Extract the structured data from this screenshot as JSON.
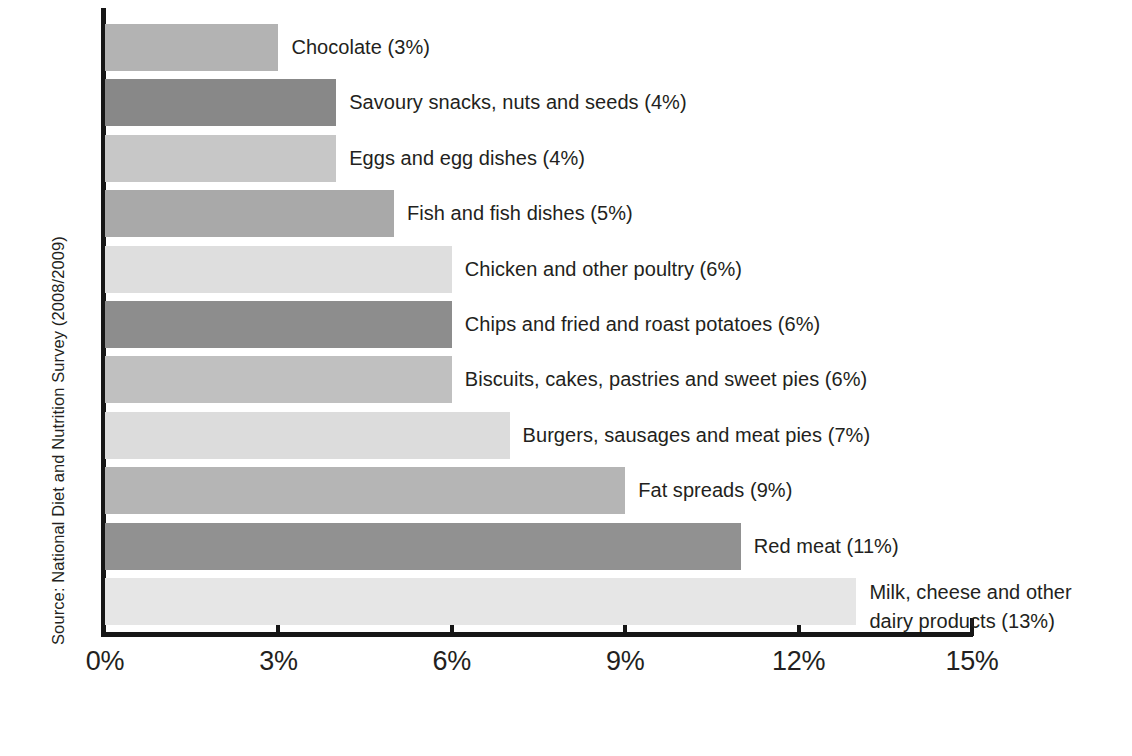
{
  "chart_data": {
    "type": "bar",
    "orientation": "horizontal",
    "title": "",
    "subtitle": "",
    "xlabel": "",
    "ylabel": "Source: National Diet and Nutrition Survey (2008/2009)",
    "xlim": [
      0,
      15
    ],
    "xticks": [
      0,
      3,
      6,
      9,
      12,
      15
    ],
    "xtick_labels": [
      "0%",
      "3%",
      "6%",
      "9%",
      "12%",
      "15%"
    ],
    "grid": false,
    "legend": false,
    "categories": [
      "Chocolate",
      "Savoury snacks, nuts and seeds",
      "Eggs and egg dishes",
      "Fish and fish dishes",
      "Chicken and other poultry",
      "Chips and fried and roast potatoes",
      "Biscuits, cakes, pastries and sweet pies",
      "Burgers, sausages and meat pies",
      "Fat spreads",
      "Red meat",
      "Milk, cheese and other dairy products"
    ],
    "values": [
      3,
      4,
      4,
      5,
      6,
      6,
      6,
      7,
      9,
      11,
      13
    ],
    "value_unit": "%",
    "bars": [
      {
        "label": "Chocolate (3%)",
        "value": 3,
        "color": "#b3b3b3",
        "lines": 1
      },
      {
        "label": "Savoury snacks, nuts and seeds (4%)",
        "value": 4,
        "color": "#888888",
        "lines": 1
      },
      {
        "label": "Eggs and egg dishes (4%)",
        "value": 4,
        "color": "#c7c7c7",
        "lines": 1
      },
      {
        "label": "Fish and fish dishes (5%)",
        "value": 5,
        "color": "#a9a9a9",
        "lines": 1
      },
      {
        "label": "Chicken and other poultry (6%)",
        "value": 6,
        "color": "#dedede",
        "lines": 1
      },
      {
        "label": "Chips and fried and roast potatoes (6%)",
        "value": 6,
        "color": "#8d8d8d",
        "lines": 1
      },
      {
        "label": "Biscuits, cakes, pastries and sweet pies (6%)",
        "value": 6,
        "color": "#c0c0c0",
        "lines": 1
      },
      {
        "label": "Burgers, sausages and meat pies (7%)",
        "value": 7,
        "color": "#dcdcdc",
        "lines": 1
      },
      {
        "label": "Fat spreads (9%)",
        "value": 9,
        "color": "#b5b5b5",
        "lines": 1
      },
      {
        "label": "Red meat (11%)",
        "value": 11,
        "color": "#919191",
        "lines": 1
      },
      {
        "label": "Milk, cheese and other\ndairy products (13%)",
        "value": 13,
        "color": "#e6e6e6",
        "lines": 2
      }
    ],
    "axis_color": "#161616"
  },
  "axis": {
    "source_note": "Source: National Diet and Nutrition Survey (2008/2009)"
  }
}
